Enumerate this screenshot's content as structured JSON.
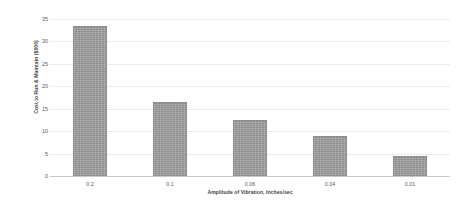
{
  "chart_data": {
    "type": "bar",
    "title": "",
    "categories": [
      "0.2",
      "0.1",
      "0.06",
      "0.04",
      "0.01"
    ],
    "values": [
      33.5,
      16.5,
      12.5,
      9,
      4.5
    ],
    "xlabel": "Amplitude of Vibration, Inches/sec",
    "ylabel": "Cost to Run & Maintain ($000)",
    "ylim": [
      0,
      35
    ],
    "yticks": [
      0,
      5,
      10,
      15,
      20,
      25,
      30,
      35
    ],
    "ytick_labels": [
      "0",
      "5",
      "10",
      "15",
      "20",
      "25",
      "30",
      "35"
    ],
    "grid": true,
    "legend": false,
    "bar_color": "#9b9b9b",
    "gridline_color": "#ebebeb",
    "axis_color": "#c9c9c9",
    "background_color": "#ffffff"
  }
}
